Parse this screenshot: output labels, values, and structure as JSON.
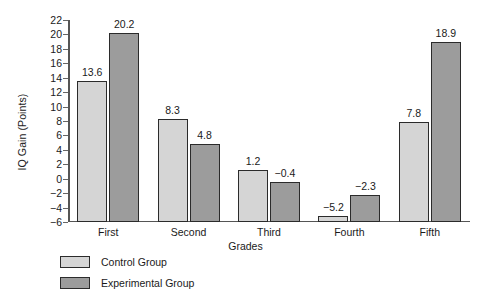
{
  "chart_data": {
    "type": "bar",
    "title": "",
    "xlabel": "Grades",
    "ylabel": "IQ Gain (Points)",
    "categories": [
      "First",
      "Second",
      "Third",
      "Fourth",
      "Fifth"
    ],
    "series": [
      {
        "name": "Control Group",
        "color": "#d5d5d5",
        "values": [
          13.6,
          8.3,
          1.2,
          -5.2,
          7.8
        ],
        "labels": [
          "13.6",
          "8.3",
          "1.2",
          "−5.2",
          "7.8"
        ]
      },
      {
        "name": "Experimental Group",
        "color": "#9c9c9c",
        "values": [
          20.2,
          4.8,
          -0.4,
          -2.3,
          18.9
        ],
        "labels": [
          "20.2",
          "4.8",
          "−0.4",
          "−2.3",
          "18.9"
        ]
      }
    ],
    "ylim": [
      -6,
      22
    ],
    "ytick_step": 2,
    "yticks": [
      22,
      20,
      18,
      16,
      14,
      12,
      10,
      8,
      6,
      4,
      2,
      0,
      -2,
      -4,
      -6
    ],
    "ytick_labels": [
      "22",
      "20",
      "18",
      "16",
      "14",
      "12",
      "10",
      "8",
      "6",
      "4",
      "2",
      "0",
      "−2",
      "−4",
      "−6"
    ],
    "bar_baseline": -6,
    "grid": false,
    "legend_position": "bottom-left",
    "bar_outline_color": "#2b2b2b"
  },
  "legend": {
    "items": [
      {
        "label": "Control Group"
      },
      {
        "label": "Experimental Group"
      }
    ]
  }
}
